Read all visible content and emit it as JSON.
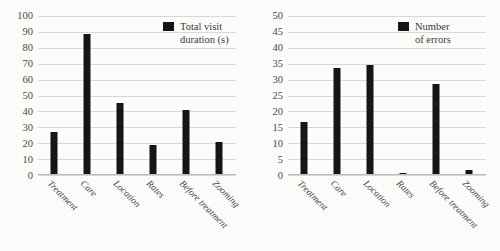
{
  "figure": {
    "background_color": "#fbfbf9",
    "bar_color": "#151515",
    "gridline_color": "#d8d8d4"
  },
  "chart_data": [
    {
      "type": "bar",
      "id": "total-visit-duration",
      "title": "",
      "xlabel": "",
      "ylabel": "",
      "categories": [
        "Treatment",
        "Care",
        "Location",
        "Rates",
        "Before treatment",
        "Zooming"
      ],
      "values": [
        27,
        89,
        45,
        19,
        41,
        21
      ],
      "series": [
        {
          "name": "Total visit duration (s)",
          "values": [
            27,
            89,
            45,
            19,
            41,
            21
          ]
        }
      ],
      "legend": {
        "position": "top-right",
        "entries": [
          "Total visit duration (s)"
        ]
      },
      "ylim": [
        0,
        100
      ],
      "yticks": [
        0,
        10,
        20,
        30,
        40,
        50,
        60,
        70,
        80,
        90,
        100
      ],
      "ytick_labels": [
        "0",
        "10",
        "20",
        "30",
        "40",
        "50",
        "60",
        "70",
        "80",
        "90",
        "100"
      ],
      "grid": true,
      "xtick_rotation": 45
    },
    {
      "type": "bar",
      "id": "number-of-errors",
      "title": "",
      "xlabel": "",
      "ylabel": "",
      "categories": [
        "Treatment",
        "Care",
        "Location",
        "Rates",
        "Before treatment",
        "Zooming"
      ],
      "values": [
        16.7,
        33.5,
        34.5,
        0.5,
        28.5,
        1.5
      ],
      "series": [
        {
          "name": "Number of errors",
          "values": [
            16.7,
            33.5,
            34.5,
            0.5,
            28.5,
            1.5
          ]
        }
      ],
      "legend": {
        "position": "top-right",
        "entries": [
          "Number of errors"
        ]
      },
      "ylim": [
        0,
        50
      ],
      "yticks": [
        0,
        5,
        10,
        15,
        20,
        25,
        30,
        35,
        40,
        45,
        50
      ],
      "ytick_labels": [
        "0",
        "5",
        "10",
        "15",
        "20",
        "25",
        "30",
        "35",
        "40",
        "45",
        "50"
      ],
      "grid": true,
      "xtick_rotation": 45
    }
  ],
  "left_chart": {
    "legend_label_line1": "Total visit",
    "legend_label_line2": "duration (s)"
  },
  "right_chart": {
    "legend_label_line1": "Number",
    "legend_label_line2": "of errors"
  }
}
